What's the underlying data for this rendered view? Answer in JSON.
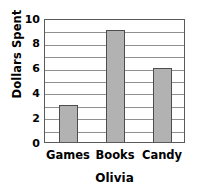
{
  "chart_data": {
    "type": "bar",
    "title": "",
    "subtitle": "",
    "xlabel": "Olivia",
    "ylabel": "Dollars Spent",
    "categories": [
      "Games",
      "Books",
      "Candy"
    ],
    "values": [
      3,
      9,
      6
    ],
    "ylim": [
      0,
      10
    ],
    "y_tick_labels": [
      "0",
      "2",
      "4",
      "6",
      "8",
      "10"
    ],
    "y_tick_values": [
      0,
      2,
      4,
      6,
      8,
      10
    ],
    "y_gridline_values": [
      1,
      2,
      3,
      4,
      5,
      6,
      7,
      8,
      9
    ],
    "y_tick_step": 2,
    "grid": true,
    "legend": "none",
    "orientation": "vertical",
    "bar_color": "#b2b2b2",
    "bar_border_color": "#4d4d4d",
    "gridline_color": "#909090",
    "axis_color": "#5a5a5a",
    "text_color": "#000000",
    "background_color": "#ffffff"
  }
}
